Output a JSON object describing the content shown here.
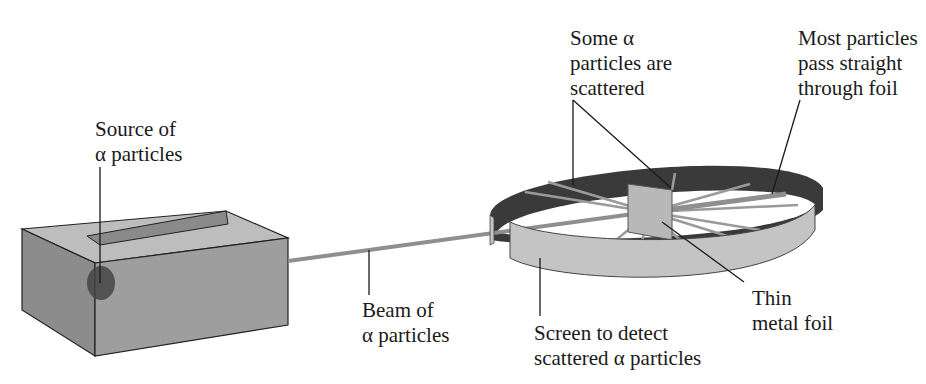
{
  "diagram": {
    "colors": {
      "background": "#ffffff",
      "box_front": "#9a9a9a",
      "box_side": "#8c8c8c",
      "box_top": "#bdbdbd",
      "slot": "#8a8a8a",
      "source_spot": "#444444",
      "beam": "#8f8f8f",
      "screen_inner": "#3a3a3a",
      "screen_outer": "#c4c4c4",
      "foil": "#b8b8b8",
      "scatter_rays": "#9a9a9a",
      "leader_lines": "#1a1a1a",
      "text": "#1a1a1a"
    },
    "labels": {
      "source": {
        "line1": "Source of",
        "line2": "α particles"
      },
      "beam": {
        "line1": "Beam of",
        "line2": "α particles"
      },
      "screen": {
        "line1": "Screen to detect",
        "line2": "scattered α particles"
      },
      "foil": {
        "line1": "Thin",
        "line2": "metal foil"
      },
      "scattered": {
        "line1": "Some α",
        "line2": "particles are",
        "line3": "scattered"
      },
      "straight": {
        "line1": "Most particles",
        "line2": "pass straight",
        "line3": "through foil"
      }
    }
  }
}
